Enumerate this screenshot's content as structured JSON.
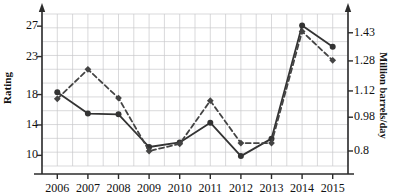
{
  "chart_data": {
    "type": "line",
    "title": "",
    "xlabel": "",
    "categories": [
      "2006",
      "2007",
      "2008",
      "2009",
      "2010",
      "2011",
      "2012",
      "2013",
      "2014",
      "2015"
    ],
    "grid": true,
    "legend_position": "none",
    "axes": {
      "left": {
        "label": "Rating",
        "ticks": [
          "10",
          "14",
          "18",
          "23",
          "27"
        ],
        "tick_values": [
          10,
          14,
          18,
          23,
          27
        ],
        "range": [
          8.6,
          28.6
        ]
      },
      "right": {
        "label": "Million barrels/day",
        "ticks": [
          "0.8",
          "0.98",
          "1.12",
          "1.28",
          "1.43"
        ],
        "tick_values": [
          0.8,
          0.98,
          1.12,
          1.28,
          1.43
        ],
        "range": [
          0.72,
          1.53
        ]
      }
    },
    "series": [
      {
        "name": "Rating",
        "axis": "left",
        "style": "solid",
        "marker": "circle",
        "color": "#333333",
        "values": [
          18.3,
          15.5,
          15.4,
          11.1,
          11.7,
          14.3,
          9.9,
          12.2,
          27.1,
          24.3
        ]
      },
      {
        "name": "Million barrels/day",
        "axis": "right",
        "style": "dashed",
        "marker": "diamond",
        "color": "#444444",
        "values": [
          1.078,
          1.235,
          1.082,
          0.8,
          0.838,
          1.068,
          0.842,
          0.842,
          1.437,
          1.283
        ]
      }
    ]
  },
  "axis_left": {
    "title": "Rating",
    "ticks": [
      {
        "label": "27"
      },
      {
        "label": "23"
      },
      {
        "label": "18"
      },
      {
        "label": "14"
      },
      {
        "label": "10"
      }
    ]
  },
  "axis_right": {
    "title": "Million barrels/day",
    "ticks": [
      {
        "label": "1.43"
      },
      {
        "label": "1.28"
      },
      {
        "label": "1.12"
      },
      {
        "label": "0.98"
      },
      {
        "label": "0.8"
      }
    ]
  },
  "axis_x": {
    "ticks": [
      {
        "label": "2006"
      },
      {
        "label": "2007"
      },
      {
        "label": "2008"
      },
      {
        "label": "2009"
      },
      {
        "label": "2010"
      },
      {
        "label": "2011"
      },
      {
        "label": "2012"
      },
      {
        "label": "2013"
      },
      {
        "label": "2014"
      },
      {
        "label": "2015"
      }
    ]
  },
  "colors": {
    "grid": "#c8c8cc",
    "axis": "#2b2b2b",
    "series_solid": "#333333",
    "series_dashed": "#444444",
    "background": "#ffffff"
  }
}
